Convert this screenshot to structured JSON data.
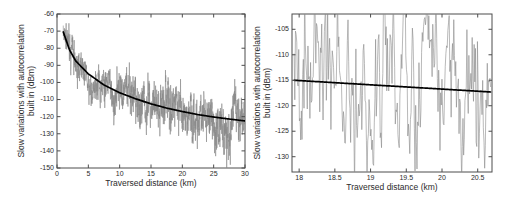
{
  "figure": {
    "background": "#ffffff",
    "noise_color": "#8a8a8a",
    "trend_color": "#000000",
    "axis_color": "#4d4d4d"
  },
  "chart_data": [
    {
      "id": "left",
      "type": "line",
      "title": "",
      "xlabel": "Traversed distance (km)",
      "ylabel": "Slow variations with autocorrelation built in (dBm)",
      "ylabel_line1": "Slow variations with autocorrelation",
      "ylabel_line2": "built in (dBm)",
      "xlim": [
        0,
        30
      ],
      "ylim": [
        -150,
        -60
      ],
      "xticks": [
        0,
        5,
        10,
        15,
        20,
        25,
        30
      ],
      "xticklabels": [
        "0",
        "5",
        "10",
        "15",
        "20",
        "25",
        "30"
      ],
      "yticks": [
        -150,
        -140,
        -130,
        -120,
        -110,
        -100,
        -90,
        -80,
        -70,
        -60
      ],
      "yticklabels": [
        "-150",
        "-140",
        "-130",
        "-120",
        "-110",
        "-100",
        "-90",
        "-80",
        "-70",
        "-60"
      ],
      "grid": false,
      "legend": null,
      "series": [
        {
          "name": "received power with shadowing",
          "kind": "noise",
          "color": "#8a8a8a",
          "x_start": 1.0,
          "x_end": 30.0,
          "n_points": 1450,
          "description": "Fast-varying autocorrelated signal about the path-loss mean, spread roughly +/- 18 dB"
        },
        {
          "name": "mean path loss",
          "kind": "trend",
          "color": "#000000",
          "model": "logarithmic",
          "anchor_points": [
            {
              "x": 1.0,
              "y": -70.5
            },
            {
              "x": 2.0,
              "y": -81.0
            },
            {
              "x": 3.0,
              "y": -87.5
            },
            {
              "x": 5.0,
              "y": -95.0
            },
            {
              "x": 7.5,
              "y": -101.5
            },
            {
              "x": 10.0,
              "y": -106.0
            },
            {
              "x": 12.5,
              "y": -109.5
            },
            {
              "x": 15.0,
              "y": -112.5
            },
            {
              "x": 17.5,
              "y": -115.0
            },
            {
              "x": 20.0,
              "y": -117.0
            },
            {
              "x": 22.5,
              "y": -118.8
            },
            {
              "x": 25.0,
              "y": -120.2
            },
            {
              "x": 27.5,
              "y": -121.4
            },
            {
              "x": 30.0,
              "y": -122.5
            }
          ]
        }
      ]
    },
    {
      "id": "right",
      "type": "line",
      "title": "",
      "xlabel": "Traversed distance (km)",
      "ylabel": "Slow variations with autocorrelation built in (dBm)",
      "ylabel_line1": "Slow variations with autocorrelation",
      "ylabel_line2": "built in (dBm)",
      "xlim": [
        17.9,
        20.7
      ],
      "ylim": [
        -133,
        -102
      ],
      "xticks": [
        18,
        18.5,
        19,
        19.5,
        20,
        20.5
      ],
      "xticklabels": [
        "18",
        "18.5",
        "19",
        "19.5",
        "20",
        "20.5"
      ],
      "yticks": [
        -130,
        -125,
        -120,
        -115,
        -110,
        -105
      ],
      "yticklabels": [
        "-130",
        "-125",
        "-120",
        "-115",
        "-110",
        "-105"
      ],
      "grid": false,
      "legend": null,
      "series": [
        {
          "name": "received power with shadowing (zoom)",
          "kind": "noise",
          "color": "#8a8a8a",
          "x_start": 17.93,
          "x_end": 20.68,
          "n_points": 300,
          "description": "Zoom of the 18-20.7 km segment showing autocorrelated oscillations between about -132 and -102 dBm"
        },
        {
          "name": "mean path loss",
          "kind": "trend",
          "color": "#000000",
          "model": "linear",
          "anchor_points": [
            {
              "x": 17.93,
              "y": -115.0
            },
            {
              "x": 20.68,
              "y": -117.3
            }
          ]
        }
      ]
    }
  ]
}
